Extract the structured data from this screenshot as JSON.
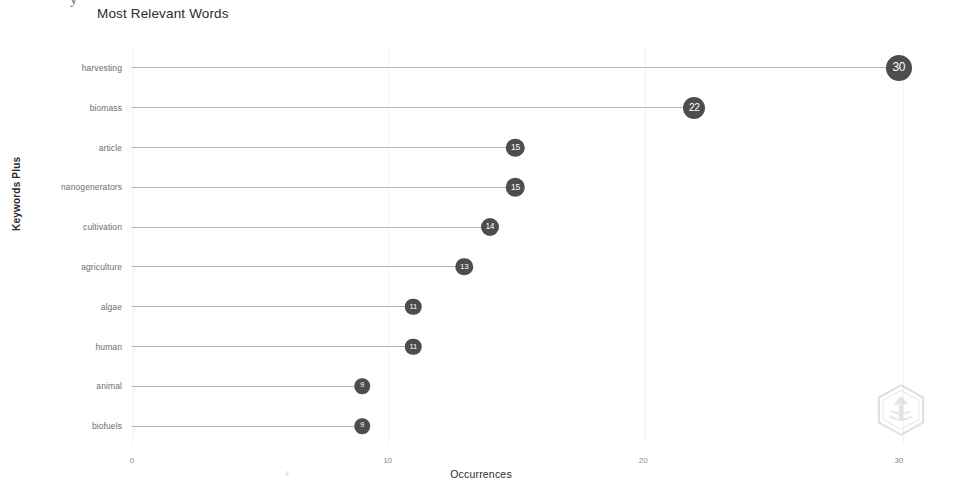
{
  "header": {
    "clipped_glyph": "y",
    "title": "Most Relevant Words"
  },
  "axes": {
    "y_title": "Keywords Plus",
    "x_title": "Occurrences",
    "x_ticks": [
      "0",
      "10",
      "20",
      "30"
    ],
    "x_minor_tick": "4"
  },
  "watermark": {
    "name": "hexagon-logo-watermark",
    "color": "#9a9a9a"
  },
  "colors": {
    "dot": "#4d4d4d",
    "stem": "#b4b4b4",
    "grid": "#f2f2f2",
    "label": "#6e6e6e",
    "title": "#2b2b2b"
  },
  "chart_data": {
    "type": "bar",
    "subtype": "lollipop-horizontal",
    "title": "Most Relevant Words",
    "xlabel": "Occurrences",
    "ylabel": "Keywords Plus",
    "xlim": [
      0,
      32
    ],
    "xticks": [
      0,
      10,
      20,
      30
    ],
    "grid": true,
    "legend": null,
    "categories": [
      "harvesting",
      "biomass",
      "article",
      "nanogenerators",
      "cultivation",
      "agriculture",
      "algae",
      "human",
      "animal",
      "biofuels"
    ],
    "values": [
      30,
      22,
      15,
      15,
      14,
      13,
      11,
      11,
      9,
      9
    ]
  }
}
